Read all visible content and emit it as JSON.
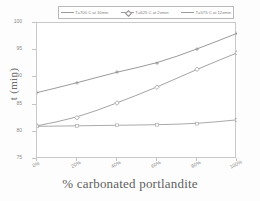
{
  "chart_data": {
    "type": "line",
    "title": "",
    "xlabel": "% carbonated portlandite",
    "ylabel": "t (min)",
    "x": [
      0,
      20,
      40,
      60,
      80,
      100
    ],
    "xtick_labels": [
      "0%",
      "20%",
      "40%",
      "60%",
      "80%",
      "100%"
    ],
    "ytick_labels": [
      "100",
      "95",
      "90",
      "85",
      "80",
      "75"
    ],
    "yticks": [
      100,
      95,
      90,
      85,
      80,
      75
    ],
    "xlim": [
      0,
      100
    ],
    "ylim": [
      75,
      100
    ],
    "grid": false,
    "legend_position": "top",
    "series": [
      {
        "name": "T=700 C at 10min",
        "marker": "cross",
        "color": "#8e8e8e",
        "values": [
          87.2,
          89.0,
          91.0,
          92.6,
          95.2,
          98.1
        ]
      },
      {
        "name": "T=625 C at 2xmin",
        "marker": "diamond",
        "color": "#9a9a9a",
        "values": [
          81.1,
          82.6,
          85.3,
          88.2,
          91.5,
          94.5
        ]
      },
      {
        "name": "T=575 C at 12xmin",
        "marker": "line",
        "color": "#a0a0a0",
        "values": [
          81.0,
          81.1,
          81.2,
          81.3,
          81.5,
          82.2
        ]
      }
    ]
  },
  "legend": {
    "entries": [
      {
        "label": "T=700 C at 10min"
      },
      {
        "label": "T=625 C at 2xmin"
      },
      {
        "label": "T=575 C at 12xmin"
      }
    ]
  },
  "axes": {
    "y_title": "t (min)",
    "x_title": "% carbonated portlandite"
  }
}
